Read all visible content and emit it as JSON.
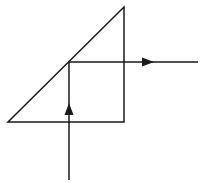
{
  "diagram": {
    "stroke_color": "#1a1a1a",
    "background": "#ffffff",
    "prism": {
      "shape": "right-triangle",
      "vertices": [
        [
          8,
          122
        ],
        [
          124,
          122
        ],
        [
          124,
          7
        ]
      ]
    },
    "ray": {
      "points": [
        [
          69,
          180
        ],
        [
          69,
          62
        ],
        [
          198,
          62
        ]
      ],
      "arrows": [
        {
          "direction": "up",
          "at": [
            69,
            110
          ]
        },
        {
          "direction": "right",
          "at": [
            148,
            62
          ]
        }
      ]
    }
  }
}
